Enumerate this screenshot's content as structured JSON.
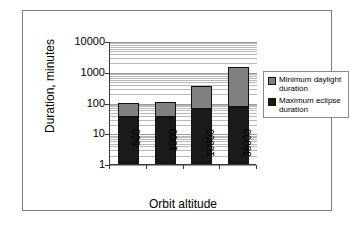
{
  "chart_data": {
    "type": "bar",
    "stacked": true,
    "title": "",
    "xlabel": "Orbit altitude",
    "ylabel": "Duration, minutes",
    "categories": [
      "500",
      "1000",
      "10000",
      "36000"
    ],
    "yscale": "log",
    "ylim": [
      1,
      10000
    ],
    "ytick_labels": [
      "1",
      "10",
      "100",
      "1000",
      "10000"
    ],
    "ytick_values": [
      1,
      10,
      100,
      1000,
      10000
    ],
    "grid": "horizontal-log-minor",
    "legend_position": "right",
    "series": [
      {
        "name": "Maximum eclipse duration",
        "color": "#1a1a1a",
        "values": [
          35,
          35,
          60,
          72
        ]
      },
      {
        "name": "Minimum daylight duration",
        "color": "#808080",
        "values": [
          65,
          70,
          290,
          1368
        ]
      }
    ],
    "stack_totals": [
      100,
      105,
      350,
      1440
    ],
    "legend": [
      {
        "label": "Minimum daylight duration",
        "color": "#808080"
      },
      {
        "label": "Maximum eclipse duration",
        "color": "#1a1a1a"
      }
    ]
  },
  "axes": {
    "y_title": "Duration, minutes",
    "x_title": "Orbit altitude",
    "y_labels": [
      "10000",
      "1000",
      "100",
      "10",
      "1"
    ],
    "x_labels": [
      "500",
      "1000",
      "10000",
      "36000"
    ]
  },
  "legend": {
    "items": [
      {
        "label_line1": "Minimum  daylight",
        "label_line2": "duration"
      },
      {
        "label_line1": "Maximum  eclipse",
        "label_line2": "duration"
      }
    ]
  },
  "colors": {
    "daylight": "#808080",
    "eclipse": "#1a1a1a",
    "frame": "#7a7a7a",
    "axis": "#3a3a3a",
    "grid": "#b9b9b9",
    "background": "#ffffff"
  }
}
